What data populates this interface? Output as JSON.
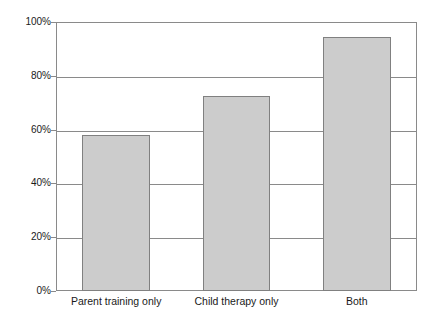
{
  "chart_data": {
    "type": "bar",
    "title": "",
    "subtitle": "",
    "xlabel": "",
    "ylabel": "",
    "categories": [
      "Parent training only",
      "Child therapy only",
      "Both"
    ],
    "values": [
      58,
      72.5,
      94.5
    ],
    "value_labels": [
      "58%",
      "72.5%",
      "94.5%"
    ],
    "series": [
      {
        "name": "",
        "values": [
          58,
          72.5,
          94.5
        ]
      }
    ],
    "ylim": [
      0,
      100
    ],
    "ytick_values": [
      0,
      20,
      40,
      60,
      80,
      100
    ],
    "ytick_labels": [
      "0%",
      "20%",
      "40%",
      "60%",
      "80%",
      "100%"
    ],
    "grid": true,
    "grid_axis": "y",
    "legend": false,
    "legend_position": "none",
    "annotations": [],
    "colors": {
      "bar_fill": "#cccccc",
      "bar_border": "#808080",
      "grid": "#8a8a8a",
      "axis": "#8a8a8a",
      "text": "#1a1a1a",
      "background": "#ffffff"
    }
  }
}
